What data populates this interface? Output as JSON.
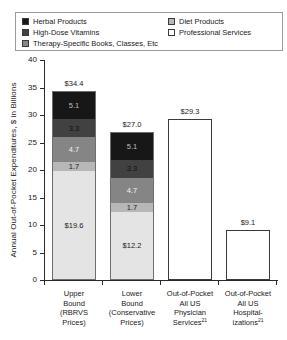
{
  "figure": {
    "background": "#ffffff"
  },
  "chart_data": {
    "type": "bar",
    "stacked": true,
    "title": "",
    "xlabel": "",
    "ylabel": "Annual Out-of-Pocket Expenditures, $ in Billions",
    "ylim": [
      0,
      40
    ],
    "ytick_step": 5,
    "yticks": [
      0,
      5,
      10,
      15,
      20,
      25,
      30,
      35,
      40
    ],
    "grid": false,
    "legend_position": "top",
    "legend_columns": [
      [
        {
          "label": "Herbal Products",
          "color": "#171717"
        },
        {
          "label": "High-Dose Vitamins",
          "color": "#414141"
        },
        {
          "label": "Therapy-Specific Books, Classes, Etc",
          "color": "#858585"
        }
      ],
      [
        {
          "label": "Diet Products",
          "color": "#b7b7b7"
        },
        {
          "label": "Professional Services",
          "color": "#ffffff"
        }
      ]
    ],
    "bars": [
      {
        "category_lines": [
          "Upper",
          "Bound",
          "(RBRVS",
          "Prices)"
        ],
        "total": 34.4,
        "total_label": "$34.4",
        "outline": "#6e6e6e",
        "segments": [
          {
            "name": "Professional Services",
            "value": 19.6,
            "label": "$19.6",
            "color": "#e4e4e4",
            "label_color": "#1a1a1a"
          },
          {
            "name": "Diet Products",
            "value": 1.7,
            "label": "1.7",
            "color": "#b7b7b7",
            "label_color": "#222222"
          },
          {
            "name": "Therapy-Specific Books, Classes, Etc",
            "value": 4.7,
            "label": "4.7",
            "color": "#858585",
            "label_color": "#f2f2f2"
          },
          {
            "name": "High-Dose Vitamins",
            "value": 3.3,
            "label": "3.3",
            "color": "#414141",
            "label_color": "#101010"
          },
          {
            "name": "Herbal Products",
            "value": 5.1,
            "label": "5.1",
            "color": "#171717",
            "label_color": "#bdbdbd"
          }
        ]
      },
      {
        "category_lines": [
          "Lower",
          "Bound",
          "(Conservative",
          "Prices)"
        ],
        "total": 27.0,
        "total_label": "$27.0",
        "outline": "#6e6e6e",
        "segments": [
          {
            "name": "Professional Services",
            "value": 12.2,
            "label": "$12.2",
            "color": "#e4e4e4",
            "label_color": "#1a1a1a"
          },
          {
            "name": "Diet Products",
            "value": 1.7,
            "label": "1.7",
            "color": "#b7b7b7",
            "label_color": "#222222"
          },
          {
            "name": "Therapy-Specific Books, Classes, Etc",
            "value": 4.7,
            "label": "4.7",
            "color": "#858585",
            "label_color": "#f2f2f2"
          },
          {
            "name": "High-Dose Vitamins",
            "value": 3.3,
            "label": "3.3",
            "color": "#414141",
            "label_color": "#101010"
          },
          {
            "name": "Herbal Products",
            "value": 5.1,
            "label": "5.1",
            "color": "#171717",
            "label_color": "#bdbdbd"
          }
        ]
      },
      {
        "category_lines": [
          "Out-of-Pocket",
          "All US",
          "Physician",
          {
            "text": "Services",
            "sup": "21"
          }
        ],
        "total": 29.3,
        "total_label": "$29.3",
        "outline": "#3a3a3a",
        "segments": [
          {
            "name": "Out-of-Pocket All US Physician Services",
            "value": 29.3,
            "label": "",
            "color": "#ffffff",
            "label_color": "#1a1a1a"
          }
        ]
      },
      {
        "category_lines": [
          "Out-of-Pocket",
          "All US",
          "Hospital-",
          {
            "text": "izations",
            "sup": "21"
          }
        ],
        "total": 9.1,
        "total_label": "$9.1",
        "outline": "#3a3a3a",
        "segments": [
          {
            "name": "Out-of-Pocket All US Hospitalizations",
            "value": 9.1,
            "label": "",
            "color": "#ffffff",
            "label_color": "#1a1a1a"
          }
        ]
      }
    ]
  }
}
